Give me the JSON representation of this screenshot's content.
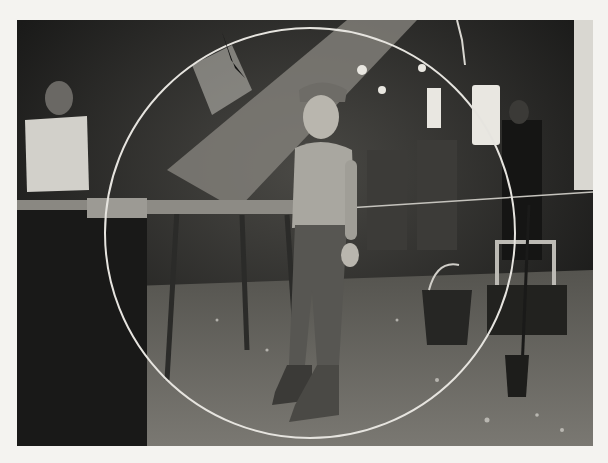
{
  "image": {
    "kind": "black-and-white photograph",
    "subject": "boy in cap standing in a factory with workers and equipment",
    "colors": {
      "page_background": "#f4f3f0",
      "dark": "#1c1c1b",
      "mid": "#6e6d69",
      "light": "#cfcdc7",
      "circle_line": "#e6e4df"
    },
    "elements": [
      {
        "name": "boy-figure",
        "description": "boy in flat cap, shirt, trousers and boots, center"
      },
      {
        "name": "worker-left",
        "description": "worker in white shirt at a bench, left"
      },
      {
        "name": "worker-right",
        "description": "worker in the background, right"
      },
      {
        "name": "diagonal-chute",
        "description": "large diagonal duct or chute, top center"
      },
      {
        "name": "work-table",
        "description": "metal frame table, left-center"
      },
      {
        "name": "bucket",
        "description": "wooden bucket with a handle, right"
      },
      {
        "name": "crate",
        "description": "wooden crate, right"
      },
      {
        "name": "rod-stand",
        "description": "vertical rod set in a small pot, right foreground"
      },
      {
        "name": "circle-overlay",
        "description": "thin white circle drawn over the image"
      },
      {
        "name": "floor",
        "description": "factory floor with debris"
      }
    ]
  }
}
